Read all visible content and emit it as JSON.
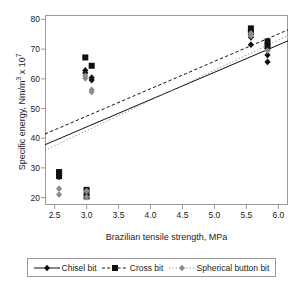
{
  "chart_data": {
    "type": "scatter",
    "title": "",
    "xlabel": "Brazilian tensile strength, MPa",
    "ylabel_parts": {
      "pre": "Specific energy, Nm/m",
      "sup1": "3",
      "mid": " x 10",
      "sup2": "7"
    },
    "ylabel": "Specific energy, Nm/m3 x 107",
    "xlim": [
      2.35,
      6.15
    ],
    "ylim": [
      17.5,
      81.5
    ],
    "xticks": [
      "2.5",
      "3.0",
      "3.5",
      "4.0",
      "4.5",
      "5.0",
      "5.5",
      "6.0"
    ],
    "xtick_values": [
      2.5,
      3.0,
      3.5,
      4.0,
      4.5,
      5.0,
      5.5,
      6.0
    ],
    "yticks": [
      "20",
      "30",
      "40",
      "50",
      "60",
      "70",
      "80"
    ],
    "ytick_values": [
      20,
      30,
      40,
      50,
      60,
      70,
      80
    ],
    "grid": false,
    "legend_position": "below",
    "series": [
      {
        "name": "Chisel bit",
        "marker": "diamond",
        "color": "#101010",
        "line_style": "solid",
        "points": [
          {
            "x": 2.57,
            "y": 27.4
          },
          {
            "x": 2.57,
            "y": 27.0
          },
          {
            "x": 2.98,
            "y": 62.8
          },
          {
            "x": 2.98,
            "y": 62.0
          },
          {
            "x": 3.08,
            "y": 60.4
          },
          {
            "x": 3.08,
            "y": 59.6
          },
          {
            "x": 3.0,
            "y": 21.0
          },
          {
            "x": 5.57,
            "y": 74.0
          },
          {
            "x": 5.57,
            "y": 71.5
          },
          {
            "x": 5.83,
            "y": 70.2
          },
          {
            "x": 5.83,
            "y": 68.0
          },
          {
            "x": 5.83,
            "y": 65.7
          }
        ],
        "fit": {
          "x1": 2.35,
          "y1": 37.8,
          "x2": 6.15,
          "y2": 72.8
        }
      },
      {
        "name": "Cross bit",
        "marker": "square",
        "color": "#101010",
        "line_style": "dashed",
        "points": [
          {
            "x": 2.57,
            "y": 28.6
          },
          {
            "x": 2.57,
            "y": 28.0
          },
          {
            "x": 2.57,
            "y": 27.2
          },
          {
            "x": 2.98,
            "y": 67.2
          },
          {
            "x": 3.08,
            "y": 64.4
          },
          {
            "x": 3.0,
            "y": 22.6
          },
          {
            "x": 3.0,
            "y": 20.4
          },
          {
            "x": 5.57,
            "y": 77.0
          },
          {
            "x": 5.57,
            "y": 75.8
          },
          {
            "x": 5.83,
            "y": 72.6
          },
          {
            "x": 5.83,
            "y": 71.0
          }
        ],
        "fit": {
          "x1": 2.35,
          "y1": 41.4,
          "x2": 6.15,
          "y2": 76.5
        }
      },
      {
        "name": "Spherical button bit",
        "marker": "diamond",
        "color": "#8c8c8c",
        "line_style": "dotted",
        "points": [
          {
            "x": 2.57,
            "y": 23.0
          },
          {
            "x": 2.57,
            "y": 21.0
          },
          {
            "x": 2.98,
            "y": 61.0
          },
          {
            "x": 2.98,
            "y": 60.2
          },
          {
            "x": 3.08,
            "y": 56.3
          },
          {
            "x": 3.08,
            "y": 55.6
          },
          {
            "x": 3.0,
            "y": 22.2
          },
          {
            "x": 3.0,
            "y": 20.2
          },
          {
            "x": 5.57,
            "y": 75.3
          },
          {
            "x": 5.57,
            "y": 74.5
          },
          {
            "x": 5.83,
            "y": 69.5
          }
        ],
        "fit": {
          "x1": 2.35,
          "y1": 35.9,
          "x2": 6.15,
          "y2": 74.6
        }
      }
    ]
  },
  "legend": {
    "items": [
      {
        "label": "Chisel bit"
      },
      {
        "label": "Cross bit"
      },
      {
        "label": "Spherical button bit"
      }
    ]
  }
}
